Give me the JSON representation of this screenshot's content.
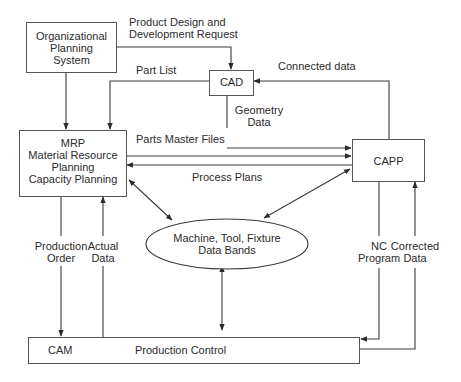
{
  "diagram": {
    "nodes": {
      "org_planning": {
        "lines": [
          "Organizational",
          "Planning",
          "System"
        ]
      },
      "cad": {
        "label": "CAD"
      },
      "mrp": {
        "lines": [
          "MRP",
          "Material Resource",
          "Planning",
          "Capacity Planning"
        ]
      },
      "capp": {
        "label": "CAPP"
      },
      "data_bands": {
        "lines": [
          "Machine, Tool, Fixture",
          "Data Bands"
        ]
      },
      "production": {
        "cam_label": "CAM",
        "label": "Production Control"
      }
    },
    "edges": {
      "product_design": {
        "lines": [
          "Product Design and",
          "Development Request"
        ]
      },
      "part_list": {
        "label": "Part List"
      },
      "connected_data": {
        "label": "Connected data"
      },
      "geometry_data": {
        "lines": [
          "Geometry",
          "Data"
        ]
      },
      "parts_master": {
        "label": "Parts Master Files"
      },
      "process_plans": {
        "label": "Process Plans"
      },
      "production_order": {
        "lines": [
          "Production",
          "Order"
        ]
      },
      "actual_data": {
        "lines": [
          "Actual",
          "Data"
        ]
      },
      "nc_program": {
        "lines": [
          "NC",
          "Program"
        ]
      },
      "corrected_data": {
        "lines": [
          "Corrected",
          "Data"
        ]
      }
    },
    "colors": {
      "line": "#3a3a3a",
      "box_border": "#555555",
      "text": "#2b2b2b"
    }
  }
}
